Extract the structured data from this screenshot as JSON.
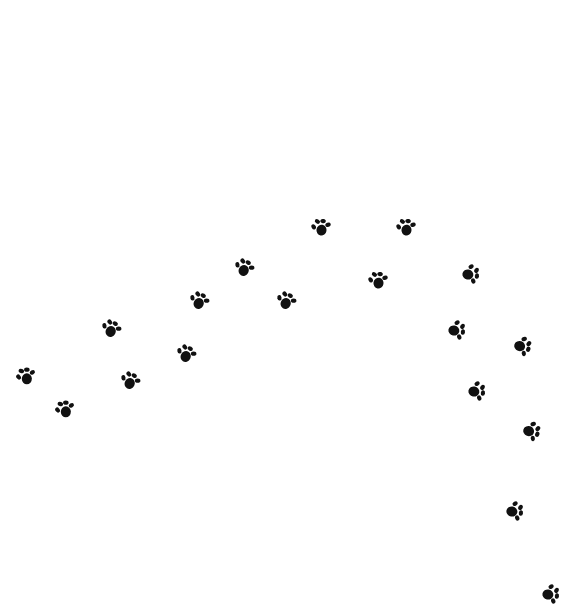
{
  "canvas": {
    "width": 557,
    "height": 610,
    "background": "#ffffff"
  },
  "paw_color": "#111111",
  "paws": [
    {
      "x": 25,
      "y": 377,
      "rot": -90
    },
    {
      "x": 64,
      "y": 410,
      "rot": -90
    },
    {
      "x": 110,
      "y": 329,
      "rot": -60
    },
    {
      "x": 129,
      "y": 381,
      "rot": -60
    },
    {
      "x": 198,
      "y": 301,
      "rot": -60
    },
    {
      "x": 185,
      "y": 354,
      "rot": -60
    },
    {
      "x": 243,
      "y": 268,
      "rot": -60
    },
    {
      "x": 285,
      "y": 301,
      "rot": -60
    },
    {
      "x": 320,
      "y": 228,
      "rot": -80
    },
    {
      "x": 377,
      "y": 281,
      "rot": -80
    },
    {
      "x": 405,
      "y": 228,
      "rot": -80
    },
    {
      "x": 470,
      "y": 273,
      "rot": 10
    },
    {
      "x": 456,
      "y": 329,
      "rot": 10
    },
    {
      "x": 522,
      "y": 345,
      "rot": 20
    },
    {
      "x": 476,
      "y": 390,
      "rot": 10
    },
    {
      "x": 531,
      "y": 430,
      "rot": 20
    },
    {
      "x": 514,
      "y": 510,
      "rot": 10
    },
    {
      "x": 550,
      "y": 593,
      "rot": 10
    }
  ]
}
